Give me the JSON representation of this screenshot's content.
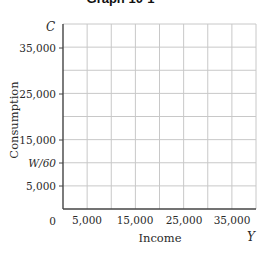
{
  "chart_data": {
    "type": "line",
    "title": "Graph 10-1",
    "xlabel": "Income",
    "ylabel": "Consumption",
    "x_axis_symbol": "Y",
    "y_axis_symbol": "C",
    "origin_label": "0",
    "x_ticks": [
      "5,000",
      "15,000",
      "25,000",
      "35,000"
    ],
    "y_ticks": [
      "35,000",
      "25,000",
      "15,000",
      "W/60",
      "5,000"
    ],
    "xlim": [
      0,
      40000
    ],
    "ylim": [
      0,
      40000
    ],
    "grid": true,
    "grid_divisions": {
      "x": 8,
      "y": 8
    },
    "series": [],
    "note": "Blank grid with no plotted data"
  },
  "labels": {
    "title": "Graph 10-1",
    "y_symbol": "C",
    "x_symbol": "Y",
    "origin": "0",
    "y_title": "Consumption",
    "x_title": "Income",
    "y_ticks": [
      {
        "text": "35,000",
        "y": 48,
        "italic": false
      },
      {
        "text": "25,000",
        "y": 94,
        "italic": false
      },
      {
        "text": "15,000",
        "y": 140,
        "italic": false
      },
      {
        "text": "W/60",
        "y": 163,
        "italic": true
      },
      {
        "text": "5,000",
        "y": 186,
        "italic": false
      }
    ],
    "x_ticks": [
      {
        "text": "5,000",
        "x": 87
      },
      {
        "text": "15,000",
        "x": 135
      },
      {
        "text": "25,000",
        "x": 184
      },
      {
        "text": "35,000",
        "x": 232
      }
    ]
  },
  "colors": {
    "grid": "#c8c8c8",
    "axis": "#444444",
    "text": "#2a2a2a"
  }
}
